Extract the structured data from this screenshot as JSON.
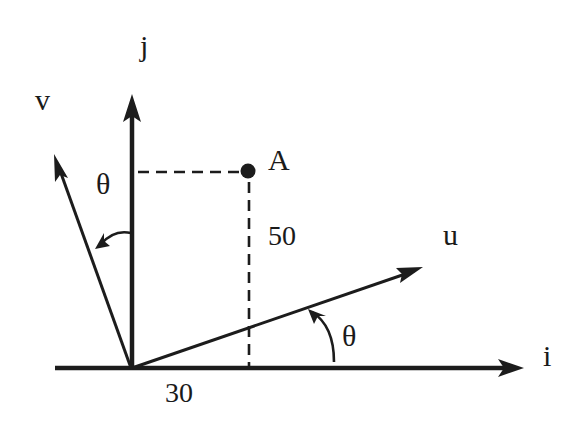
{
  "diagram": {
    "type": "coordinate-rotation-diagram",
    "axes": {
      "i_label": "i",
      "j_label": "j"
    },
    "rotated_axes": {
      "u_label": "u",
      "v_label": "v"
    },
    "point": {
      "label": "A",
      "x_value": "30",
      "y_value": "50"
    },
    "angles": {
      "theta_u": "θ",
      "theta_v": "θ"
    },
    "colors": {
      "ink": "#1c1c1c",
      "background": "#ffffff"
    }
  }
}
